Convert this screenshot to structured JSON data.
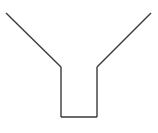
{
  "diagram": {
    "shape": "funnel-outline",
    "stroke_color": "#3a3a3a",
    "background_color": "#ffffff"
  }
}
